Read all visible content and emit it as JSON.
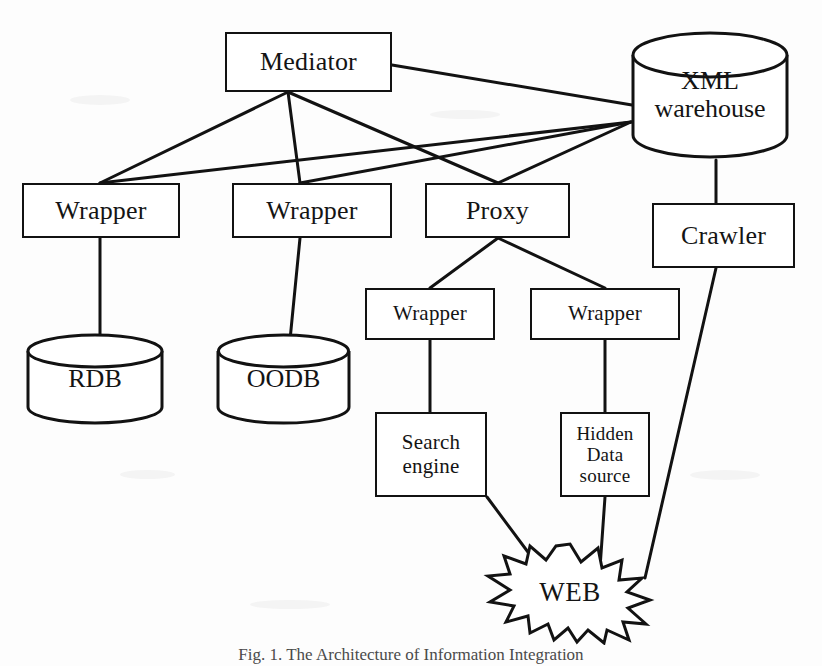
{
  "figure": {
    "caption": "Fig. 1. The Architecture of Information Integration",
    "background_color": "#fdfdfd",
    "stroke_color": "#121212"
  },
  "nodes": {
    "mediator": {
      "label": "Mediator",
      "shape": "rectangle",
      "x": 225,
      "y": 32,
      "w": 167,
      "h": 60
    },
    "xml_warehouse": {
      "label": "XML\nwarehouse",
      "shape": "cylinder",
      "x": 630,
      "y": 30,
      "w": 160,
      "h": 130
    },
    "wrapper_rdb": {
      "label": "Wrapper",
      "shape": "rectangle",
      "x": 22,
      "y": 183,
      "w": 158,
      "h": 55
    },
    "wrapper_oodb": {
      "label": "Wrapper",
      "shape": "rectangle",
      "x": 232,
      "y": 183,
      "w": 160,
      "h": 55
    },
    "proxy": {
      "label": "Proxy",
      "shape": "rectangle",
      "x": 425,
      "y": 183,
      "w": 145,
      "h": 55
    },
    "crawler": {
      "label": "Crawler",
      "shape": "rectangle",
      "x": 652,
      "y": 203,
      "w": 143,
      "h": 65
    },
    "rdb": {
      "label": "RDB",
      "shape": "cylinder",
      "x": 25,
      "y": 333,
      "w": 140,
      "h": 92
    },
    "oodb": {
      "label": "OODB",
      "shape": "cylinder",
      "x": 215,
      "y": 333,
      "w": 137,
      "h": 92
    },
    "wrapper_search": {
      "label": "Wrapper",
      "shape": "rectangle",
      "x": 365,
      "y": 288,
      "w": 130,
      "h": 52
    },
    "wrapper_hidden": {
      "label": "Wrapper",
      "shape": "rectangle",
      "x": 530,
      "y": 288,
      "w": 150,
      "h": 52
    },
    "search_engine": {
      "label": "Search\nengine",
      "shape": "rectangle",
      "x": 375,
      "y": 412,
      "w": 112,
      "h": 85
    },
    "hidden_data_source": {
      "label": "Hidden\nData\nsource",
      "shape": "rectangle",
      "x": 560,
      "y": 412,
      "w": 90,
      "h": 85
    },
    "web": {
      "label": "WEB",
      "shape": "starburst",
      "x": 480,
      "y": 540,
      "w": 180,
      "h": 105
    }
  },
  "edges": [
    {
      "from": "mediator",
      "to": "xml_warehouse"
    },
    {
      "from": "mediator",
      "to": "wrapper_rdb"
    },
    {
      "from": "mediator",
      "to": "wrapper_oodb"
    },
    {
      "from": "mediator",
      "to": "proxy"
    },
    {
      "from": "xml_warehouse",
      "to": "wrapper_rdb"
    },
    {
      "from": "xml_warehouse",
      "to": "wrapper_oodb"
    },
    {
      "from": "xml_warehouse",
      "to": "proxy"
    },
    {
      "from": "xml_warehouse",
      "to": "crawler"
    },
    {
      "from": "wrapper_rdb",
      "to": "rdb"
    },
    {
      "from": "wrapper_oodb",
      "to": "oodb"
    },
    {
      "from": "proxy",
      "to": "wrapper_search"
    },
    {
      "from": "proxy",
      "to": "wrapper_hidden"
    },
    {
      "from": "wrapper_search",
      "to": "search_engine"
    },
    {
      "from": "wrapper_hidden",
      "to": "hidden_data_source"
    },
    {
      "from": "search_engine",
      "to": "web"
    },
    {
      "from": "hidden_data_source",
      "to": "web"
    },
    {
      "from": "crawler",
      "to": "web"
    }
  ]
}
